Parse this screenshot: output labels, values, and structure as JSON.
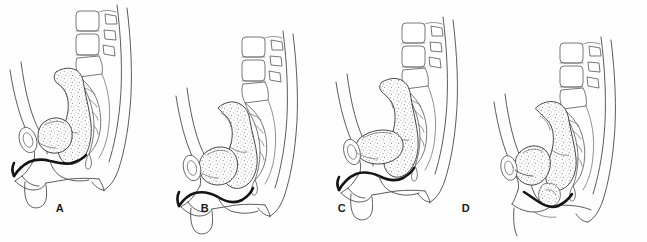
{
  "figure": {
    "background_color": "#fefefe",
    "ink_color": "#4a4a4a",
    "heavy_ink_color": "#141414",
    "stipple_color": "#8f8f8f",
    "panel_count": 4
  },
  "panels": [
    {
      "label": "A",
      "label_x": 60,
      "label_y": 209,
      "offset_x": 0,
      "vertical_shift": 0,
      "description": "Normal resting position; bladder and urethra supported, uterus anteverted over bladder"
    },
    {
      "label": "B",
      "label_x": 205,
      "label_y": 209,
      "offset_x": 162,
      "vertical_shift": 22,
      "description": "Bladder base descended, urethra rotated downward"
    },
    {
      "label": "C",
      "label_x": 342,
      "label_y": 209,
      "offset_x": 324,
      "vertical_shift": 10,
      "description": "Bladder flattened and elongated, urethrovesical angle lost"
    },
    {
      "label": "D",
      "label_x": 466,
      "label_y": 209,
      "offset_x": 486,
      "vertical_shift": 30,
      "description": "Marked descent of bladder and uterus toward introitus"
    }
  ],
  "structures": {
    "vertebrae": "lumbar-vertebral-bodies",
    "sacrum": "sacrum-and-coccyx",
    "bladder": "urinary-bladder",
    "urethra": "urethra",
    "uterus_rectum": "uterus-and-rectal-mass",
    "pubis": "pubic-symphysis",
    "body_outline": "abdominal-and-gluteal-contour",
    "thigh": "thigh-contour"
  }
}
